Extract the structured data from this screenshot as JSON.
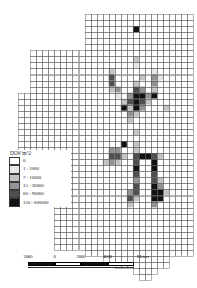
{
  "figure": {
    "kind": "choropleth-grid-map",
    "background_color": "#ffffff"
  },
  "legend": {
    "title": "DLW m^2",
    "entries": [
      {
        "label": "0",
        "color": "#ffffff"
      },
      {
        "label": "1 - 2000",
        "color": "#e8e8e8"
      },
      {
        "label": "7 - 10000",
        "color": "#c4c4c4"
      },
      {
        "label": "15 - 30000",
        "color": "#949494"
      },
      {
        "label": "60 - 90000",
        "color": "#4f4f4f"
      },
      {
        "label": "150 - 600000",
        "color": "#121212"
      }
    ]
  },
  "scalebar": {
    "labels": [
      "2000",
      "0",
      "2000",
      "4000"
    ],
    "units": "Meters",
    "segments": [
      "dark",
      "light",
      "dark",
      "light"
    ]
  },
  "chart_data": {
    "type": "heatmap",
    "title": "DLW m^2",
    "xlabel": "",
    "ylabel": "",
    "legend_position": "left-lower",
    "grid": true,
    "cell_size_px": 6.05,
    "origin_px": [
      18,
      14
    ],
    "cols": 29,
    "rows": 44,
    "class_breaks": [
      0,
      1,
      7,
      15,
      60,
      150,
      600000
    ],
    "class_colors": [
      "#ffffff",
      "#e8e8e8",
      "#c4c4c4",
      "#949494",
      "#4f4f4f",
      "#121212"
    ],
    "grid_line_color": "#5a5a5a",
    "footprint": [
      {
        "row": 0,
        "c0": 11,
        "c1": 28
      },
      {
        "row": 1,
        "c0": 11,
        "c1": 28
      },
      {
        "row": 2,
        "c0": 11,
        "c1": 28
      },
      {
        "row": 3,
        "c0": 11,
        "c1": 28
      },
      {
        "row": 4,
        "c0": 11,
        "c1": 28
      },
      {
        "row": 5,
        "c0": 11,
        "c1": 28
      },
      {
        "row": 6,
        "c0": 2,
        "c1": 28
      },
      {
        "row": 7,
        "c0": 2,
        "c1": 28
      },
      {
        "row": 8,
        "c0": 2,
        "c1": 28
      },
      {
        "row": 9,
        "c0": 2,
        "c1": 28
      },
      {
        "row": 10,
        "c0": 2,
        "c1": 28
      },
      {
        "row": 11,
        "c0": 2,
        "c1": 28
      },
      {
        "row": 12,
        "c0": 2,
        "c1": 28
      },
      {
        "row": 13,
        "c0": 0,
        "c1": 28
      },
      {
        "row": 14,
        "c0": 0,
        "c1": 28
      },
      {
        "row": 15,
        "c0": 0,
        "c1": 28
      },
      {
        "row": 16,
        "c0": 0,
        "c1": 28
      },
      {
        "row": 17,
        "c0": 0,
        "c1": 28
      },
      {
        "row": 18,
        "c0": 0,
        "c1": 28
      },
      {
        "row": 19,
        "c0": 0,
        "c1": 28
      },
      {
        "row": 20,
        "c0": 0,
        "c1": 28
      },
      {
        "row": 21,
        "c0": 0,
        "c1": 28
      },
      {
        "row": 22,
        "c0": 0,
        "c1": 28
      },
      {
        "row": 23,
        "c0": 0,
        "c1": 28
      },
      {
        "row": 24,
        "c0": 0,
        "c1": 28
      },
      {
        "row": 25,
        "c0": 0,
        "c1": 28
      },
      {
        "row": 26,
        "c0": 0,
        "c1": 28
      },
      {
        "row": 27,
        "c0": 0,
        "c1": 28
      },
      {
        "row": 28,
        "c0": 0,
        "c1": 28
      },
      {
        "row": 29,
        "c0": 0,
        "c1": 28
      },
      {
        "row": 30,
        "c0": 6,
        "c1": 28
      },
      {
        "row": 31,
        "c0": 6,
        "c1": 28
      },
      {
        "row": 32,
        "c0": 6,
        "c1": 28
      },
      {
        "row": 33,
        "c0": 6,
        "c1": 28
      },
      {
        "row": 34,
        "c0": 6,
        "c1": 28
      },
      {
        "row": 35,
        "c0": 6,
        "c1": 28
      },
      {
        "row": 36,
        "c0": 6,
        "c1": 28
      },
      {
        "row": 37,
        "c0": 6,
        "c1": 28
      },
      {
        "row": 38,
        "c0": 6,
        "c1": 28
      },
      {
        "row": 39,
        "c0": 11,
        "c1": 28
      },
      {
        "row": 40,
        "c0": 14,
        "c1": 24
      },
      {
        "row": 41,
        "c0": 16,
        "c1": 24
      },
      {
        "row": 42,
        "c0": 19,
        "c1": 22
      },
      {
        "row": 43,
        "c0": 20,
        "c1": 21
      }
    ],
    "cells": [
      {
        "row": 2,
        "col": 19,
        "class": 5
      },
      {
        "row": 7,
        "col": 19,
        "class": 2
      },
      {
        "row": 8,
        "col": 19,
        "class": 1
      },
      {
        "row": 9,
        "col": 15,
        "class": 2
      },
      {
        "row": 9,
        "col": 22,
        "class": 1
      },
      {
        "row": 10,
        "col": 15,
        "class": 4
      },
      {
        "row": 10,
        "col": 20,
        "class": 2
      },
      {
        "row": 10,
        "col": 22,
        "class": 3
      },
      {
        "row": 10,
        "col": 23,
        "class": 1
      },
      {
        "row": 11,
        "col": 15,
        "class": 4
      },
      {
        "row": 11,
        "col": 19,
        "class": 2
      },
      {
        "row": 11,
        "col": 22,
        "class": 3
      },
      {
        "row": 12,
        "col": 15,
        "class": 2
      },
      {
        "row": 12,
        "col": 16,
        "class": 3
      },
      {
        "row": 12,
        "col": 19,
        "class": 4
      },
      {
        "row": 12,
        "col": 20,
        "class": 3
      },
      {
        "row": 12,
        "col": 22,
        "class": 2
      },
      {
        "row": 13,
        "col": 16,
        "class": 1
      },
      {
        "row": 13,
        "col": 18,
        "class": 3
      },
      {
        "row": 13,
        "col": 19,
        "class": 5
      },
      {
        "row": 13,
        "col": 20,
        "class": 5
      },
      {
        "row": 13,
        "col": 21,
        "class": 3
      },
      {
        "row": 13,
        "col": 22,
        "class": 5
      },
      {
        "row": 14,
        "col": 17,
        "class": 2
      },
      {
        "row": 14,
        "col": 18,
        "class": 4
      },
      {
        "row": 14,
        "col": 19,
        "class": 5
      },
      {
        "row": 14,
        "col": 20,
        "class": 4
      },
      {
        "row": 14,
        "col": 21,
        "class": 2
      },
      {
        "row": 15,
        "col": 17,
        "class": 5
      },
      {
        "row": 15,
        "col": 18,
        "class": 2
      },
      {
        "row": 15,
        "col": 19,
        "class": 5
      },
      {
        "row": 15,
        "col": 20,
        "class": 3
      },
      {
        "row": 15,
        "col": 24,
        "class": 2
      },
      {
        "row": 16,
        "col": 18,
        "class": 3
      },
      {
        "row": 16,
        "col": 19,
        "class": 2
      },
      {
        "row": 17,
        "col": 18,
        "class": 2
      },
      {
        "row": 19,
        "col": 19,
        "class": 2
      },
      {
        "row": 21,
        "col": 17,
        "class": 5
      },
      {
        "row": 21,
        "col": 19,
        "class": 2
      },
      {
        "row": 22,
        "col": 15,
        "class": 3
      },
      {
        "row": 22,
        "col": 16,
        "class": 3
      },
      {
        "row": 22,
        "col": 19,
        "class": 2
      },
      {
        "row": 23,
        "col": 15,
        "class": 4
      },
      {
        "row": 23,
        "col": 16,
        "class": 4
      },
      {
        "row": 23,
        "col": 17,
        "class": 2
      },
      {
        "row": 23,
        "col": 19,
        "class": 4
      },
      {
        "row": 23,
        "col": 20,
        "class": 5
      },
      {
        "row": 23,
        "col": 21,
        "class": 5
      },
      {
        "row": 23,
        "col": 22,
        "class": 4
      },
      {
        "row": 23,
        "col": 23,
        "class": 2
      },
      {
        "row": 24,
        "col": 14,
        "class": 2
      },
      {
        "row": 24,
        "col": 15,
        "class": 3
      },
      {
        "row": 24,
        "col": 16,
        "class": 2
      },
      {
        "row": 24,
        "col": 19,
        "class": 4
      },
      {
        "row": 24,
        "col": 22,
        "class": 5
      },
      {
        "row": 25,
        "col": 19,
        "class": 5
      },
      {
        "row": 25,
        "col": 22,
        "class": 5
      },
      {
        "row": 26,
        "col": 19,
        "class": 4
      },
      {
        "row": 26,
        "col": 22,
        "class": 4
      },
      {
        "row": 27,
        "col": 19,
        "class": 3
      },
      {
        "row": 27,
        "col": 22,
        "class": 4
      },
      {
        "row": 27,
        "col": 23,
        "class": 2
      },
      {
        "row": 28,
        "col": 19,
        "class": 4
      },
      {
        "row": 28,
        "col": 22,
        "class": 5
      },
      {
        "row": 28,
        "col": 23,
        "class": 3
      },
      {
        "row": 29,
        "col": 18,
        "class": 3
      },
      {
        "row": 29,
        "col": 19,
        "class": 4
      },
      {
        "row": 29,
        "col": 22,
        "class": 5
      },
      {
        "row": 29,
        "col": 23,
        "class": 5
      },
      {
        "row": 29,
        "col": 24,
        "class": 2
      },
      {
        "row": 30,
        "col": 18,
        "class": 4
      },
      {
        "row": 30,
        "col": 19,
        "class": 2
      },
      {
        "row": 30,
        "col": 22,
        "class": 5
      },
      {
        "row": 30,
        "col": 23,
        "class": 5
      },
      {
        "row": 31,
        "col": 18,
        "class": 2
      },
      {
        "row": 31,
        "col": 22,
        "class": 3
      }
    ]
  }
}
